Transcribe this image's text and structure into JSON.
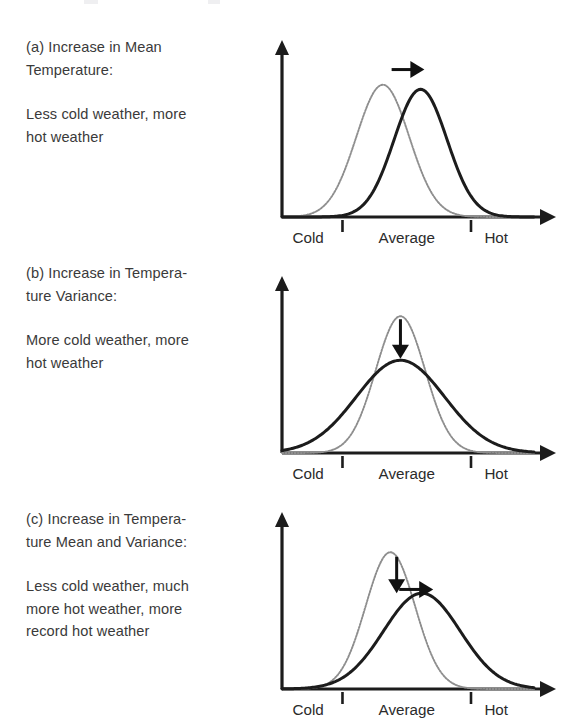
{
  "figure": {
    "panels": [
      {
        "id": "a",
        "caption_title": "(a) Increase in Mean\nTemperature:",
        "caption_body": "Less cold weather, more\nhot weather",
        "annotations": [
          "right-arrow"
        ]
      },
      {
        "id": "b",
        "caption_title": "(b) Increase in Tempera-\nture Variance:",
        "caption_body": "More cold weather, more\nhot weather",
        "annotations": [
          "down-arrow"
        ]
      },
      {
        "id": "c",
        "caption_title": "(c) Increase in Tempera-\nture Mean and Variance:",
        "caption_body": "Less cold weather, much\nmore hot weather, more\nrecord hot weather",
        "annotations": [
          "down-arrow",
          "right-arrow"
        ]
      }
    ],
    "axis_labels": {
      "cold": "Cold",
      "average": "Average",
      "hot": "Hot"
    },
    "colors": {
      "ink": "#1c1c1c",
      "text": "#3a3a3a",
      "previous_curve": "#8e8e8e",
      "new_curve": "#1c1c1c",
      "background": "#ffffff"
    }
  },
  "chart_data": {
    "type": "line",
    "xlabel": "Temperature",
    "ylabel": "Probability of occurrence",
    "xlim": [
      0,
      1
    ],
    "ylim": [
      0,
      1
    ],
    "grid": false,
    "legend": "none",
    "x_tick_labels": [
      "Cold",
      "Average",
      "Hot"
    ],
    "x_tick_boundaries": [
      0.24,
      0.75
    ],
    "panels": [
      {
        "id": "a",
        "label": "(a) Increase in Mean Temperature",
        "series": [
          {
            "name": "Previous climate",
            "style": "dotted",
            "distribution": "normal",
            "mean": 0.4,
            "sigma": 0.105,
            "peak_height": 0.87
          },
          {
            "name": "New climate",
            "style": "solid",
            "distribution": "normal",
            "mean": 0.55,
            "sigma": 0.105,
            "peak_height": 0.84
          }
        ],
        "annotations": [
          {
            "type": "arrow",
            "direction": "right",
            "x_from": 0.435,
            "x_to": 0.565,
            "y": 0.97
          }
        ]
      },
      {
        "id": "b",
        "label": "(b) Increase in Temperature Variance",
        "series": [
          {
            "name": "Previous climate",
            "style": "dotted",
            "distribution": "normal",
            "mean": 0.47,
            "sigma": 0.098,
            "peak_height": 0.9
          },
          {
            "name": "New climate",
            "style": "solid",
            "distribution": "normal",
            "mean": 0.47,
            "sigma": 0.175,
            "peak_height": 0.61
          }
        ],
        "annotations": [
          {
            "type": "arrow",
            "direction": "down",
            "x": 0.47,
            "y_from": 0.88,
            "y_to": 0.62
          }
        ]
      },
      {
        "id": "c",
        "label": "(c) Increase in Temperature Mean and Variance",
        "series": [
          {
            "name": "Previous climate",
            "style": "dotted",
            "distribution": "normal",
            "mean": 0.43,
            "sigma": 0.098,
            "peak_height": 0.9
          },
          {
            "name": "New climate",
            "style": "solid",
            "distribution": "normal",
            "mean": 0.555,
            "sigma": 0.152,
            "peak_height": 0.63
          }
        ],
        "annotations": [
          {
            "type": "arrow",
            "direction": "down",
            "x": 0.455,
            "y_from": 0.87,
            "y_to": 0.63
          },
          {
            "type": "arrow",
            "direction": "right",
            "x_from": 0.465,
            "x_to": 0.6,
            "y": 0.655
          }
        ]
      }
    ]
  }
}
